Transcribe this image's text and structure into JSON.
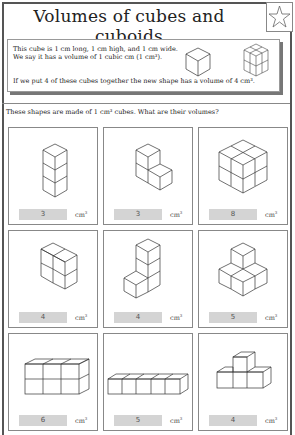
{
  "title": "Volumes of cubes and cuboids",
  "star_icon": "star-outline-icon",
  "intro": {
    "line1": "This cube is 1 cm long, 1 cm high, and 1 cm wide.",
    "line2": "We say it has a volume of 1 cubic cm (1 cm³).",
    "line3": "If we put 4 of these cubes together the new shape has a volume of 4 cm³."
  },
  "question": "These shapes are made of 1 cm³ cubes. What are their volumes?",
  "unit": "cm",
  "unit_sup": "3",
  "shapes": [
    {
      "answer": "3"
    },
    {
      "answer": "3"
    },
    {
      "answer": "8"
    },
    {
      "answer": "4"
    },
    {
      "answer": "4"
    },
    {
      "answer": "5"
    },
    {
      "answer": "6"
    },
    {
      "answer": "5"
    },
    {
      "answer": "4"
    }
  ]
}
